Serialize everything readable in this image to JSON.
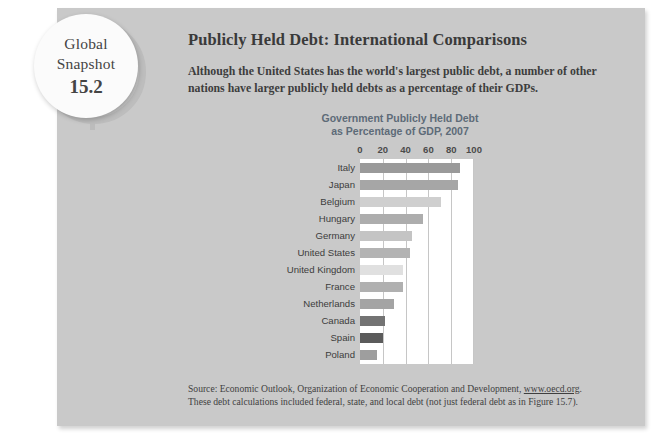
{
  "badge": {
    "line1": "Global",
    "line2": "Snapshot",
    "number": "15.2"
  },
  "header": {
    "title": "Publicly Held Debt: International Comparisons",
    "subtitle": "Although the United States has the world's largest public debt, a number of other nations have larger publicly held debts as a percentage of their GDPs."
  },
  "source": {
    "line1_prefix": "Source: Economic Outlook, Organization of Economic Cooperation and Development, ",
    "link": "www.oecd.org",
    "line1_suffix": ".",
    "line2": "These debt calculations included federal, state, and local debt (not just federal debt as in Figure 15.7)."
  },
  "colors": {
    "panel": "#c9c9c9",
    "plot_background": "#ffffff",
    "gridline": "#c6c6c6",
    "title": "#5d6b78",
    "text": "#3d3d3d"
  },
  "chart_data": {
    "type": "bar",
    "orientation": "horizontal",
    "title": "Government Publicly Held Debt as Percentage of GDP, 2007",
    "title_line1": "Government Publicly Held Debt",
    "title_line2": "as Percentage of GDP, 2007",
    "xlabel": "",
    "ylabel": "",
    "xlim": [
      0,
      100
    ],
    "ticks": [
      0,
      20,
      40,
      60,
      80,
      100
    ],
    "tick_labels": [
      "0",
      "20",
      "40",
      "60",
      "80",
      "100"
    ],
    "grid": true,
    "legend": "none",
    "categories": [
      "Italy",
      "Japan",
      "Belgium",
      "Hungary",
      "Germany",
      "United States",
      "United Kingdom",
      "France",
      "Netherlands",
      "Canada",
      "Spain",
      "Poland"
    ],
    "values": [
      88,
      86,
      71,
      55,
      46,
      44,
      38,
      38,
      30,
      22,
      20,
      15
    ],
    "bar_colors": [
      "#9a9a9a",
      "#a6a6a6",
      "#cfcfcf",
      "#adadad",
      "#c4c4c4",
      "#b3b3b3",
      "#e0e0e0",
      "#b0b0b0",
      "#a4a4a4",
      "#737373",
      "#5b5b5b",
      "#9e9e9e"
    ]
  }
}
